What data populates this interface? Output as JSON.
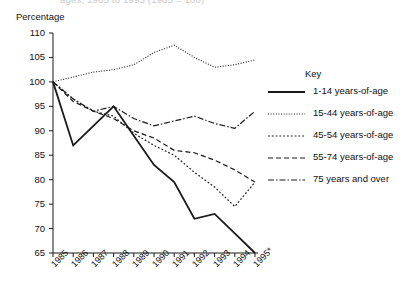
{
  "figure": {
    "cut_title": "ages, 1985 to 1995 (1985 = 100)",
    "y_axis_title": "Percentage",
    "legend_title": "Key"
  },
  "chart_data": {
    "type": "line",
    "title": "",
    "xlabel": "",
    "ylabel": "Percentage",
    "ylim": [
      65,
      110
    ],
    "yticks": [
      65,
      70,
      75,
      80,
      85,
      90,
      95,
      100,
      105,
      110
    ],
    "grid": false,
    "legend_position": "right",
    "categories": [
      "1985",
      "1986",
      "1987",
      "1988",
      "1989",
      "1990",
      "1991",
      "1992",
      "1993",
      "1994",
      "1995*"
    ],
    "series": [
      {
        "name": "1-14 years-of-age",
        "style": "solid",
        "values": [
          100,
          87,
          91,
          95,
          89,
          83,
          79.5,
          72,
          73,
          69,
          65
        ]
      },
      {
        "name": "15-44 years-of-age",
        "style": "fine-dotted",
        "values": [
          100,
          101,
          102,
          102.5,
          103.5,
          106,
          107.5,
          105,
          103,
          103.5,
          104.5
        ]
      },
      {
        "name": "45-54 years-of-age",
        "style": "dotted",
        "values": [
          100,
          96.5,
          94,
          93,
          89.5,
          87,
          85,
          81.5,
          78.5,
          74.5,
          79.5
        ]
      },
      {
        "name": "55-74 years-of-age",
        "style": "dashed",
        "values": [
          100,
          96,
          94,
          92.5,
          90,
          88.5,
          86,
          85.5,
          84,
          82,
          79.5
        ]
      },
      {
        "name": "75 years and over",
        "style": "dash-dot",
        "values": [
          100,
          96.5,
          94,
          95,
          92.5,
          91,
          92,
          93,
          91.5,
          90.5,
          94
        ]
      }
    ]
  }
}
